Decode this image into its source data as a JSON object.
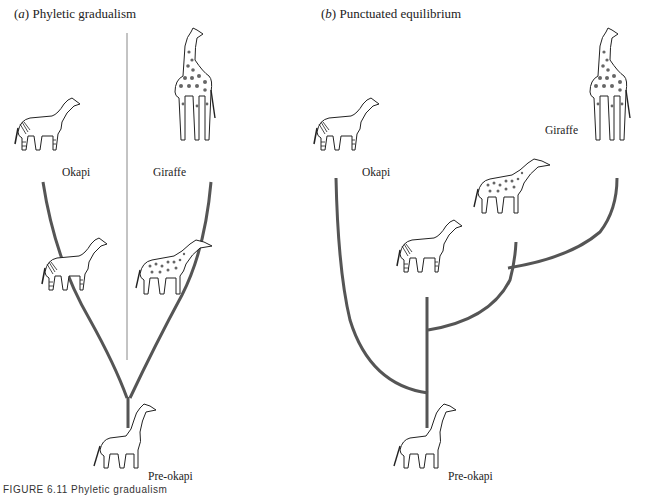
{
  "panels": {
    "a": {
      "letter": "a",
      "title": "Phyletic gradualism"
    },
    "b": {
      "letter": "b",
      "title": "Punctuated equilibrium"
    }
  },
  "labels": {
    "a_okapi": "Okapi",
    "a_giraffe": "Giraffe",
    "a_preokapi": "Pre-okapi",
    "b_okapi": "Okapi",
    "b_giraffe": "Giraffe",
    "b_preokapi": "Pre-okapi"
  },
  "caption": "FIGURE 6.11  Phyletic gradualism",
  "colors": {
    "branch": "#555555",
    "divider": "#888888",
    "ink": "#222222"
  },
  "icons": {
    "okapi": "okapi-illustration",
    "giraffe": "giraffe-illustration",
    "intermediate_okapi": "intermediate-okapi-illustration",
    "intermediate_giraffe": "intermediate-giraffe-illustration",
    "preokapi": "pre-okapi-illustration"
  }
}
